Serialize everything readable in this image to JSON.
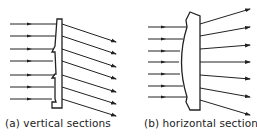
{
  "figure": {
    "panel_a": {
      "label": "(a) vertical sections",
      "ray_count": 7
    },
    "panel_b": {
      "label": "(b) horizontal sections",
      "ray_count": 7
    },
    "colors": {
      "line": "#222222",
      "background": "#ffffff"
    }
  }
}
